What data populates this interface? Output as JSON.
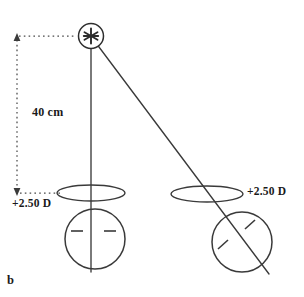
{
  "figure": {
    "panel_label": "b",
    "distance_label": "40 cm",
    "left_lens_power_label": "+2.50 D",
    "right_lens_power_label": "+2.50 D",
    "background_color": "#ffffff",
    "line_color": "#3a3a3a",
    "text_color": "#1a1a1a"
  },
  "elements": {
    "source": {
      "name": "point-source-star",
      "center_x": 91,
      "center_y": 36,
      "ring_radius": 13,
      "star_arms": 6
    },
    "rays": [
      {
        "name": "ray-to-left-eye",
        "x1": 91,
        "y1": 36,
        "x2": 91,
        "y2": 272
      },
      {
        "name": "ray-to-right-eye",
        "x1": 93,
        "y1": 40,
        "x2": 268,
        "y2": 272
      }
    ],
    "left_lens": {
      "name": "left-lens-ellipse",
      "center_x": 91,
      "center_y": 193,
      "rx": 34,
      "ry": 8
    },
    "right_lens": {
      "name": "right-lens-ellipse",
      "center_x": 207,
      "center_y": 194,
      "rx": 36,
      "ry": 8
    },
    "left_eye": {
      "name": "left-eye-circle",
      "center_x": 95,
      "center_y": 239,
      "radius": 30,
      "axis_orientation_deg": 0
    },
    "right_eye": {
      "name": "right-eye-circle",
      "center_x": 242,
      "center_y": 242,
      "radius": 30,
      "axis_orientation_deg": 45
    },
    "dimension": {
      "name": "distance-dimension-40cm",
      "line_x": 17,
      "top_y": 36,
      "bottom_y": 193,
      "top_leader_to_x": 76,
      "bottom_leader_to_x": 58
    }
  }
}
